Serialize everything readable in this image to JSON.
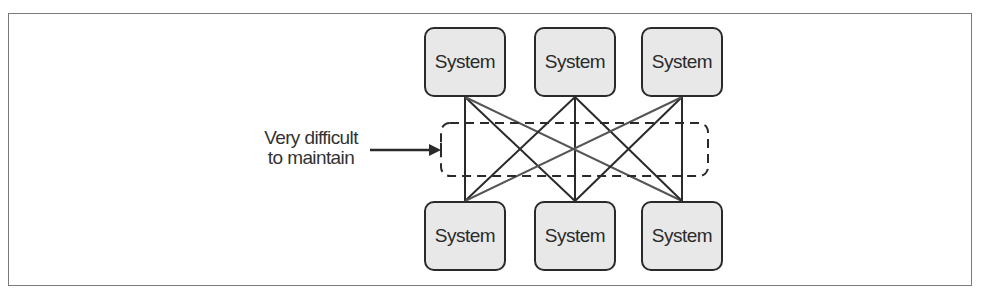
{
  "diagram": {
    "type": "point-to-point integration mesh",
    "top_systems": [
      {
        "label": "System"
      },
      {
        "label": "System"
      },
      {
        "label": "System"
      }
    ],
    "bottom_systems": [
      {
        "label": "System"
      },
      {
        "label": "System"
      },
      {
        "label": "System"
      }
    ],
    "annotation": {
      "line1": "Very difficult",
      "line2": "to maintain"
    },
    "colors": {
      "node_fill": "#e8e8e8",
      "node_border": "#2a2a2a",
      "connector": "#2a2a2a",
      "frame": "#7a7a7a"
    }
  }
}
